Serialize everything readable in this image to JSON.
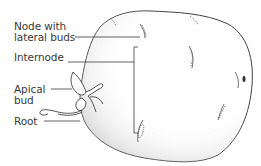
{
  "diagram": {
    "labels": {
      "node": "Node with lateral buds",
      "node_line1": "Node with",
      "node_line2": "lateral buds",
      "internode": "Internode",
      "apical_line1": "Apical",
      "apical_line2": "bud",
      "root": "Root"
    },
    "colors": {
      "outline": "#2a2a2a",
      "text": "#3a3a3a",
      "stipple": "#8a8a8a",
      "background": "#ffffff"
    }
  }
}
